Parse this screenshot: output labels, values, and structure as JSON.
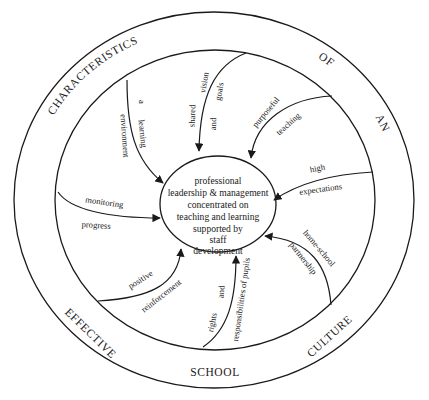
{
  "diagram": {
    "title_ring": {
      "words": [
        "CHARACTERISTICS",
        "OF",
        "AN",
        "EFFECTIVE",
        "SCHOOL",
        "CULTURE"
      ],
      "phrase": "CHARACTERISTICS OF AN EFFECTIVE SCHOOL CULTURE"
    },
    "core": {
      "lines": [
        "professional",
        "leadership & management",
        "concentrated on",
        "teaching and learning",
        "supported by",
        "staff",
        "development"
      ]
    },
    "arrows": [
      {
        "id": "learning-environment",
        "label_lines": [
          "a learning",
          "environment"
        ]
      },
      {
        "id": "shared-vision",
        "label_lines": [
          "shared vision",
          "and goals"
        ]
      },
      {
        "id": "purposeful-teaching",
        "label_lines": [
          "purposeful",
          "teaching"
        ]
      },
      {
        "id": "high-expectations",
        "label_lines": [
          "high",
          "expectations"
        ]
      },
      {
        "id": "monitoring-progress",
        "label_lines": [
          "monitoring",
          "progress"
        ]
      },
      {
        "id": "home-school-partnership",
        "label_lines": [
          "home-school",
          "partnership"
        ]
      },
      {
        "id": "positive-reinforcement",
        "label_lines": [
          "positive",
          "reinforcement"
        ]
      },
      {
        "id": "rights-responsibilities",
        "label_lines": [
          "rights and",
          "responsibilities of pupils"
        ]
      }
    ],
    "arrow_words": {
      "a": "a",
      "learning": "learning",
      "environment": "environment",
      "shared": "shared",
      "vision": "vision",
      "and": "and",
      "goals": "goals",
      "purposeful": "purposeful",
      "teaching": "teaching",
      "high": "high",
      "expectations": "expectations",
      "monitoring": "monitoring",
      "progress": "progress",
      "home_school": "home-school",
      "partnership": "partnership",
      "positive": "positive",
      "reinforcement": "reinforcement",
      "rights": "rights",
      "responsibilities_of_pupils": "responsibilities  of  pupils"
    },
    "colors": {
      "ink": "#1a1a1a",
      "background": "#ffffff"
    }
  }
}
